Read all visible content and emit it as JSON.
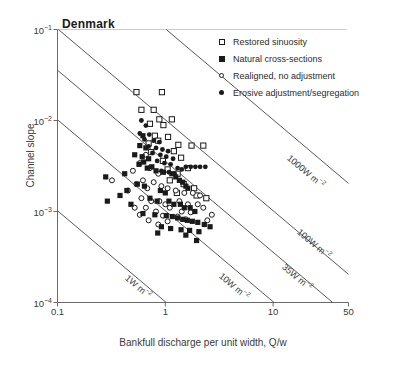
{
  "chart_data": {
    "type": "scatter",
    "title": "Denmark",
    "xlabel": "Bankfull discharge per unit width, Q/w",
    "ylabel": "Channel slope",
    "xscale": "log",
    "yscale": "log",
    "xlim": [
      0.1,
      50
    ],
    "ylim": [
      0.0001,
      0.1
    ],
    "xticks": [
      "0.1",
      "1",
      "10",
      "50"
    ],
    "xtick_values": [
      0.1,
      1,
      10,
      50
    ],
    "yticks": [
      "10-1",
      "10-2",
      "10-3",
      "10-4"
    ],
    "ytick_values": [
      0.1,
      0.01,
      0.001,
      0.0001
    ],
    "grid": false,
    "legend_position": "top-right",
    "series": [
      {
        "name": "Restored sinuosity",
        "marker": "open-square",
        "color": "#1a1a1a",
        "points": [
          [
            0.54,
            0.0205
          ],
          [
            0.93,
            0.0205
          ],
          [
            0.6,
            0.0131
          ],
          [
            0.78,
            0.0131
          ],
          [
            0.88,
            0.0103
          ],
          [
            1.15,
            0.0103
          ],
          [
            0.72,
            0.0092
          ],
          [
            0.96,
            0.0089
          ],
          [
            0.8,
            0.0068
          ],
          [
            1.06,
            0.0066
          ],
          [
            0.86,
            0.006
          ],
          [
            0.7,
            0.0056
          ],
          [
            1.32,
            0.0054
          ],
          [
            1.75,
            0.0053
          ],
          [
            2.25,
            0.0053
          ],
          [
            1.2,
            0.0046
          ],
          [
            0.74,
            0.0045
          ],
          [
            1.4,
            0.0039
          ],
          [
            0.95,
            0.0036
          ],
          [
            1.62,
            0.003
          ],
          [
            1.05,
            0.0029
          ],
          [
            1.3,
            0.0026
          ],
          [
            1.1,
            0.0022
          ],
          [
            1.48,
            0.002
          ],
          [
            1.85,
            0.0018
          ],
          [
            1.28,
            0.0016
          ],
          [
            1.95,
            0.0015
          ],
          [
            2.4,
            0.0014
          ]
        ]
      },
      {
        "name": "Natural cross-sections",
        "marker": "filled-square",
        "color": "#1a1a1a",
        "points": [
          [
            0.62,
            0.0068
          ],
          [
            0.58,
            0.0053
          ],
          [
            0.66,
            0.005
          ],
          [
            0.52,
            0.0042
          ],
          [
            0.61,
            0.004
          ],
          [
            0.7,
            0.0038
          ],
          [
            0.63,
            0.0035
          ],
          [
            0.57,
            0.0033
          ],
          [
            0.75,
            0.0031
          ],
          [
            0.42,
            0.0026
          ],
          [
            0.28,
            0.0024
          ],
          [
            0.68,
            0.003
          ],
          [
            0.82,
            0.0028
          ],
          [
            0.96,
            0.0027
          ],
          [
            1.15,
            0.0026
          ],
          [
            1.25,
            0.0024
          ],
          [
            1.35,
            0.0022
          ],
          [
            1.45,
            0.0021
          ],
          [
            1.55,
            0.0019
          ],
          [
            1.62,
            0.0018
          ],
          [
            0.55,
            0.002
          ],
          [
            0.64,
            0.0019
          ],
          [
            0.44,
            0.0017
          ],
          [
            0.38,
            0.0015
          ],
          [
            0.29,
            0.0013
          ],
          [
            0.48,
            0.0012
          ],
          [
            0.9,
            0.0017
          ],
          [
            1.0,
            0.0016
          ],
          [
            0.72,
            0.0014
          ],
          [
            0.84,
            0.0013
          ],
          [
            1.08,
            0.0013
          ],
          [
            1.2,
            0.0012
          ],
          [
            1.38,
            0.0012
          ],
          [
            1.5,
            0.0011
          ],
          [
            1.7,
            0.0011
          ],
          [
            1.88,
            0.001
          ],
          [
            0.62,
            0.00095
          ],
          [
            0.8,
            0.00092
          ],
          [
            1.02,
            0.0009
          ],
          [
            1.16,
            0.00088
          ],
          [
            1.3,
            0.00085
          ],
          [
            1.45,
            0.00082
          ],
          [
            1.6,
            0.0008
          ],
          [
            1.78,
            0.00078
          ],
          [
            2.0,
            0.00076
          ],
          [
            2.3,
            0.00072
          ],
          [
            2.6,
            0.00068
          ],
          [
            0.92,
            0.00068
          ],
          [
            1.12,
            0.00065
          ],
          [
            1.4,
            0.00063
          ],
          [
            1.68,
            0.00062
          ],
          [
            2.05,
            0.0006
          ],
          [
            0.85,
            0.00058
          ],
          [
            1.55,
            0.00055
          ],
          [
            1.95,
            0.00048
          ]
        ]
      },
      {
        "name": "Realigned, no adjustment",
        "marker": "open-circle",
        "color": "#1a1a1a",
        "points": [
          [
            0.66,
            0.0042
          ],
          [
            0.58,
            0.0034
          ],
          [
            0.72,
            0.003
          ],
          [
            0.5,
            0.0028
          ],
          [
            0.86,
            0.0026
          ],
          [
            0.32,
            0.0022
          ],
          [
            0.62,
            0.0022
          ],
          [
            0.78,
            0.0021
          ],
          [
            0.54,
            0.002
          ],
          [
            0.92,
            0.0019
          ],
          [
            0.68,
            0.0018
          ],
          [
            0.45,
            0.0017
          ],
          [
            1.05,
            0.0018
          ],
          [
            1.25,
            0.0017
          ],
          [
            1.5,
            0.0016
          ],
          [
            1.8,
            0.0016
          ],
          [
            2.1,
            0.0015
          ],
          [
            0.6,
            0.0014
          ],
          [
            0.74,
            0.0013
          ],
          [
            0.88,
            0.0013
          ],
          [
            1.0,
            0.0012
          ],
          [
            1.35,
            0.0013
          ],
          [
            1.62,
            0.0012
          ],
          [
            2.0,
            0.0012
          ],
          [
            0.52,
            0.0011
          ],
          [
            0.66,
            0.0011
          ],
          [
            0.82,
            0.001
          ],
          [
            1.1,
            0.0011
          ],
          [
            1.42,
            0.001
          ],
          [
            1.72,
            0.00098
          ],
          [
            2.25,
            0.0011
          ],
          [
            0.58,
            0.00092
          ],
          [
            0.95,
            0.0009
          ],
          [
            1.3,
            0.00088
          ],
          [
            0.7,
            0.0008
          ],
          [
            1.05,
            0.00078
          ],
          [
            1.55,
            0.00082
          ],
          [
            2.45,
            0.0008
          ],
          [
            0.86,
            0.00072
          ],
          [
            2.7,
            0.00092
          ]
        ]
      },
      {
        "name": "Erosive adjustment/segregation",
        "marker": "filled-circle",
        "color": "#1a1a1a",
        "points": [
          [
            0.6,
            0.01
          ],
          [
            0.66,
            0.0088
          ],
          [
            0.58,
            0.0072
          ],
          [
            0.71,
            0.007
          ],
          [
            0.64,
            0.0062
          ],
          [
            0.78,
            0.006
          ],
          [
            0.88,
            0.0058
          ],
          [
            0.7,
            0.0052
          ],
          [
            0.82,
            0.005
          ],
          [
            0.94,
            0.0048
          ],
          [
            1.06,
            0.0046
          ],
          [
            0.76,
            0.0044
          ],
          [
            0.9,
            0.0042
          ],
          [
            1.02,
            0.004
          ],
          [
            1.18,
            0.0038
          ],
          [
            0.84,
            0.0036
          ],
          [
            0.98,
            0.0034
          ],
          [
            1.12,
            0.0033
          ],
          [
            1.55,
            0.0031
          ],
          [
            1.72,
            0.0031
          ],
          [
            1.9,
            0.0031
          ],
          [
            2.1,
            0.0031
          ],
          [
            2.35,
            0.0031
          ],
          [
            1.3,
            0.003
          ],
          [
            1.42,
            0.0029
          ],
          [
            0.92,
            0.0028
          ],
          [
            1.08,
            0.0027
          ],
          [
            1.22,
            0.0026
          ]
        ]
      }
    ],
    "reference_lines": [
      {
        "label": "1W m-2",
        "power": 1,
        "label_x": 0.44,
        "label_y": 0.00023
      },
      {
        "label": "10W m-2",
        "power": 10,
        "label_x": 3.3,
        "label_y": 0.00024
      },
      {
        "label": "35W m-2",
        "power": 35,
        "label_x": 12.5,
        "label_y": 0.0003
      },
      {
        "label": "100W m-2",
        "power": 100,
        "label_x": 17.5,
        "label_y": 0.00072
      },
      {
        "label": "1000W m-2",
        "power": 1000,
        "label_x": 14.0,
        "label_y": 0.0048
      }
    ]
  }
}
